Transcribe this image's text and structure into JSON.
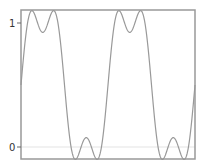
{
  "chart_data": {
    "type": "line",
    "title": "",
    "xlabel": "",
    "ylabel": "",
    "x_range": [
      0,
      12.566
    ],
    "ylim": [
      -0.1,
      1.1
    ],
    "yticks": [
      0,
      1
    ],
    "ytick_labels": [
      "0",
      "1"
    ],
    "xticks": [],
    "grid": {
      "horizontal_at": [
        0
      ],
      "color": "#e0e0e0"
    },
    "series": [
      {
        "name": "square-wave-approximation",
        "color": "#999999",
        "periods": 2,
        "harmonics": [
          1,
          3
        ],
        "offset": 0.5,
        "amplitude": 0.6366,
        "sample_points": [
          {
            "t": 0.0,
            "y": 0.5
          },
          {
            "t": 0.785,
            "y": 1.1
          },
          {
            "t": 1.571,
            "y": 0.924
          },
          {
            "t": 2.356,
            "y": 1.1
          },
          {
            "t": 3.142,
            "y": 0.5
          },
          {
            "t": 3.927,
            "y": -0.1
          },
          {
            "t": 4.712,
            "y": 0.076
          },
          {
            "t": 5.498,
            "y": -0.1
          },
          {
            "t": 6.283,
            "y": 0.5
          },
          {
            "t": 7.069,
            "y": 1.1
          },
          {
            "t": 7.854,
            "y": 0.924
          },
          {
            "t": 8.639,
            "y": 1.1
          },
          {
            "t": 9.425,
            "y": 0.5
          },
          {
            "t": 10.21,
            "y": -0.1
          },
          {
            "t": 10.996,
            "y": 0.076
          },
          {
            "t": 11.781,
            "y": -0.1
          },
          {
            "t": 12.566,
            "y": 0.5
          }
        ]
      }
    ],
    "legend": null
  },
  "axes": {
    "frame_color": "#999999",
    "ytick_labels": [
      "1",
      "0"
    ]
  }
}
